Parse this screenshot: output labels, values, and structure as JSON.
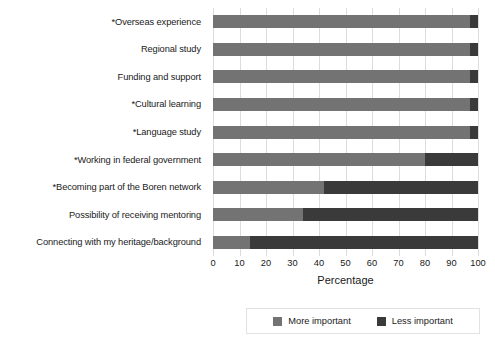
{
  "chart_data": {
    "type": "bar",
    "subtype": "stacked-horizontal-100",
    "title": "",
    "xlabel": "Percentage",
    "ylabel": "",
    "xlim": [
      0,
      100
    ],
    "xticks": [
      0,
      10,
      20,
      30,
      40,
      50,
      60,
      70,
      80,
      90,
      100
    ],
    "grid": true,
    "legend_position": "bottom-right",
    "categories": [
      "*Overseas experience",
      "Regional study",
      "Funding and support",
      "*Cultural learning",
      "*Language study",
      "*Working in federal government",
      "*Becoming part of the Boren network",
      "Possibility of receiving mentoring",
      "Connecting with my heritage/background"
    ],
    "series": [
      {
        "name": "More important",
        "color": "#737373",
        "values": [
          97,
          97,
          97,
          97,
          97,
          80,
          42,
          34,
          14
        ]
      },
      {
        "name": "Less important",
        "color": "#3a3a3a",
        "values": [
          3,
          3,
          3,
          3,
          3,
          20,
          58,
          66,
          86
        ]
      }
    ]
  },
  "legend": {
    "items": [
      {
        "label": "More important",
        "color": "#737373"
      },
      {
        "label": "Less important",
        "color": "#3a3a3a"
      }
    ]
  },
  "axis": {
    "x_title": "Percentage"
  }
}
